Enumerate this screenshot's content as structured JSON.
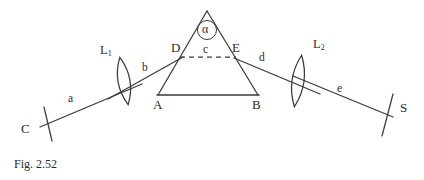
{
  "figure": {
    "caption": "Fig. 2.52",
    "line_color": "#3a3a3a",
    "text_color": "#2b2b2b",
    "background": "#ffffff"
  },
  "points": {
    "source": "C",
    "screen": "S",
    "prism_base_left": "A",
    "prism_base_right": "B",
    "entry_face_point": "D",
    "exit_face_point": "E",
    "apex_angle": "α"
  },
  "lenses": [
    {
      "name": "L",
      "sub": "1"
    },
    {
      "name": "L",
      "sub": "2"
    }
  ],
  "rays": [
    {
      "id": "a",
      "label": "a"
    },
    {
      "id": "b",
      "label": "b"
    },
    {
      "id": "c",
      "label": "c"
    },
    {
      "id": "d",
      "label": "d"
    },
    {
      "id": "e",
      "label": "e"
    }
  ]
}
